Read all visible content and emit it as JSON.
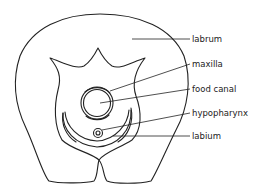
{
  "diagram": {
    "title": "",
    "labels": [
      {
        "id": "labrum",
        "text": "labrum"
      },
      {
        "id": "maxilla",
        "text": "maxilla"
      },
      {
        "id": "food_canal",
        "text": "food canal"
      },
      {
        "id": "hypopharynx",
        "text": "hypopharynx"
      },
      {
        "id": "labium",
        "text": "labium"
      }
    ],
    "colors": {
      "line": "#222222",
      "background": "#ffffff"
    }
  }
}
